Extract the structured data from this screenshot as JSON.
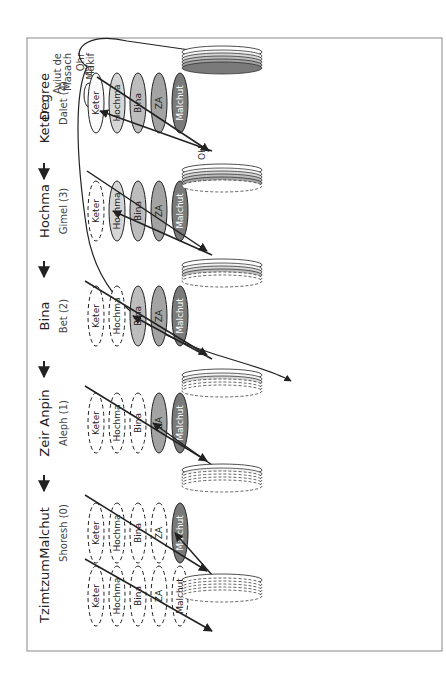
{
  "figure": {
    "orientation": "rotated-90-ccw",
    "caption_line1": "Figure 31. Levels of Hizdakchut of Partzuf.",
    "caption_line2": "(The Preamble to the Wisdom of Kabbalah, P.35)",
    "header_degree": "Degree",
    "header_aviut": "Aviut de Masach",
    "aviut_line1": "Aviut de",
    "aviut_line2": "Masach"
  },
  "stages": [
    {
      "name": "Keter",
      "aviut": "Dalet (4)",
      "level": 4
    },
    {
      "name": "Hochma",
      "aviut": "Gimel (3)",
      "level": 3
    },
    {
      "name": "Bina",
      "aviut": "Bet (2)",
      "level": 2
    },
    {
      "name": "Zeir Anpin",
      "aviut": "Aleph (1)",
      "level": 1
    },
    {
      "name": "Malchut",
      "aviut": "Shoresh (0)",
      "level": 0
    },
    {
      "name": "Tzimtzum",
      "aviut": "",
      "level": -1
    }
  ],
  "sefirot": [
    "Keter",
    "Hochma",
    "Bina",
    "ZA",
    "Malchut"
  ],
  "masach_levels": [
    "Shoresh",
    "Aleph",
    "Bet",
    "Gimel",
    "Dalet"
  ],
  "labels": {
    "ohr_makif_1": "Ohr",
    "ohr_makif_2": "Makif",
    "oy": "OY",
    "oh": "OH",
    "peh": "Peh",
    "tabur": "Tabur",
    "sium": "Sium",
    "hizdakchut": "Hizdakchut of Masach"
  },
  "colors": {
    "frame": "#888888",
    "line": "#222222",
    "shade_keter": "#f2f2f2",
    "shade_hochma": "#d6d6d6",
    "shade_bina": "#bdbdbd",
    "shade_za": "#a3a3a3",
    "shade_malchut": "#7a7a7a"
  }
}
